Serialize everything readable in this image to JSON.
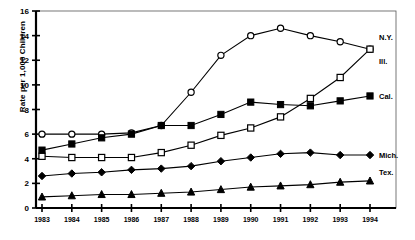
{
  "chart_data": {
    "type": "line",
    "title": "",
    "xlabel": "",
    "ylabel": "Rate per 1,000 Children",
    "x": [
      1983,
      1984,
      1985,
      1986,
      1987,
      1988,
      1989,
      1990,
      1991,
      1992,
      1993,
      1994
    ],
    "xtick_labels": [
      "1983",
      "1984",
      "1985",
      "1986",
      "1987",
      "1988",
      "1989",
      "1990",
      "1991",
      "1992",
      "1993",
      "1994"
    ],
    "ytick_labels": [
      "0",
      "2",
      "4",
      "6",
      "8",
      "10",
      "12",
      "14",
      "16"
    ],
    "yticks": [
      0,
      2,
      4,
      6,
      8,
      10,
      12,
      14,
      16
    ],
    "ylim": [
      0,
      16
    ],
    "grid": false,
    "legend_position": "right-inline",
    "series": [
      {
        "name": "N.Y.",
        "label": "N.Y.",
        "marker": "open-circle",
        "values": [
          6.0,
          6.0,
          6.0,
          6.1,
          6.7,
          9.4,
          12.4,
          14.0,
          14.6,
          14.0,
          13.5,
          12.9
        ]
      },
      {
        "name": "Ill.",
        "label": "Ill.",
        "marker": "open-square",
        "values": [
          4.2,
          4.1,
          4.1,
          4.1,
          4.5,
          5.1,
          5.9,
          6.5,
          7.4,
          8.9,
          10.6,
          12.9
        ]
      },
      {
        "name": "Cal.",
        "label": "Cal.",
        "marker": "filled-square",
        "values": [
          4.7,
          5.2,
          5.7,
          6.0,
          6.7,
          6.7,
          7.6,
          8.6,
          8.4,
          8.3,
          8.7,
          9.1
        ]
      },
      {
        "name": "Mich.",
        "label": "Mich.",
        "marker": "filled-diamond",
        "values": [
          2.6,
          2.8,
          2.9,
          3.1,
          3.2,
          3.4,
          3.8,
          4.1,
          4.4,
          4.5,
          4.3,
          4.3
        ]
      },
      {
        "name": "Tex.",
        "label": "Tex.",
        "marker": "filled-triangle",
        "values": [
          0.9,
          1.0,
          1.1,
          1.1,
          1.2,
          1.3,
          1.5,
          1.7,
          1.8,
          1.9,
          2.1,
          2.2
        ]
      }
    ]
  }
}
